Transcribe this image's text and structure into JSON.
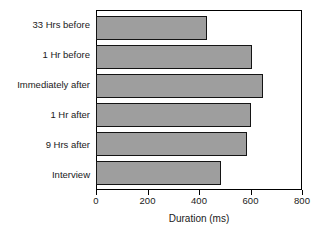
{
  "chart_data": {
    "type": "bar",
    "orientation": "horizontal",
    "title": "",
    "xlabel": "Duration (ms)",
    "ylabel": "",
    "categories": [
      "33 Hrs before",
      "1 Hr before",
      "Immediately after",
      "1 Hr after",
      "9 Hrs after",
      "Interview"
    ],
    "values": [
      430,
      605,
      650,
      600,
      585,
      485
    ],
    "xlim": [
      0,
      800
    ],
    "xticks": [
      0,
      200,
      400,
      600,
      800
    ],
    "xticklabels": [
      "0",
      "200",
      "400",
      "600",
      "800"
    ],
    "grid": false,
    "legend": null,
    "bar_fill_color": "#9e9e9e",
    "bar_edge_color": "#141414",
    "axis_color": "#000000",
    "background_color": "#ffffff"
  }
}
